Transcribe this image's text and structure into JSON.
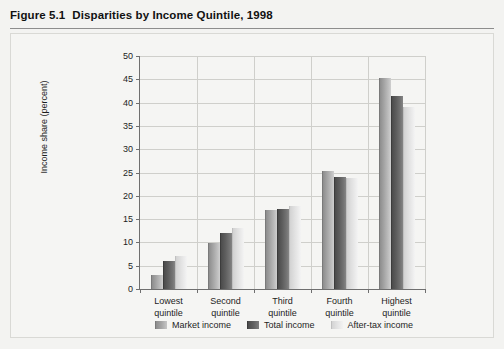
{
  "figure": {
    "number": "Figure 5.1",
    "title": "Disparities by Income Quintile, 1998"
  },
  "legend": {
    "items": [
      {
        "label": "Market income",
        "key": "market",
        "color": "#a3a3a3"
      },
      {
        "label": "Total income",
        "key": "total",
        "color": "#5e5e5e"
      },
      {
        "label": "After-tax income",
        "key": "aftertax",
        "color": "#e6e6e6"
      }
    ]
  },
  "chart_data": {
    "type": "bar",
    "title": "Disparities by Income Quintile, 1998",
    "xlabel": "",
    "ylabel": "Income share (percent)",
    "ylim": [
      0,
      50
    ],
    "ytick_step": 5,
    "yticks": [
      0,
      5,
      10,
      15,
      20,
      25,
      30,
      35,
      40,
      45,
      50
    ],
    "ytick_labels": [
      "0",
      "5",
      "10",
      "15",
      "20",
      "25",
      "30",
      "35",
      "40",
      "45",
      "50"
    ],
    "grid": "horizontal-and-vertical",
    "legend_position": "bottom-center",
    "categories": [
      "Lowest quintile",
      "Second quintile",
      "Third quintile",
      "Fourth quintile",
      "Highest quintile"
    ],
    "category_lines": [
      [
        "Lowest",
        "quintile"
      ],
      [
        "Second",
        "quintile"
      ],
      [
        "Third",
        "quintile"
      ],
      [
        "Fourth",
        "quintile"
      ],
      [
        "Highest",
        "quintile"
      ]
    ],
    "series": [
      {
        "name": "Market income",
        "key": "market",
        "color": "#a3a3a3",
        "values": [
          3.1,
          9.9,
          16.9,
          25.3,
          45.3
        ]
      },
      {
        "name": "Total income",
        "key": "total",
        "color": "#5e5e5e",
        "values": [
          6.0,
          12.1,
          17.2,
          24.1,
          41.5
        ]
      },
      {
        "name": "After-tax income",
        "key": "aftertax",
        "color": "#e6e6e6",
        "values": [
          7.0,
          13.0,
          17.9,
          23.8,
          39.0
        ]
      }
    ]
  }
}
